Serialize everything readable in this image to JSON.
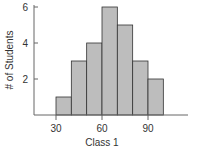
{
  "chart_data": {
    "type": "bar",
    "subtype": "histogram",
    "title": "",
    "xlabel": "Class 1",
    "ylabel": "# of Students",
    "bins": [
      [
        30,
        40
      ],
      [
        40,
        50
      ],
      [
        50,
        60
      ],
      [
        60,
        70
      ],
      [
        70,
        80
      ],
      [
        80,
        90
      ],
      [
        90,
        100
      ]
    ],
    "categories": [
      "30-40",
      "40-50",
      "50-60",
      "60-70",
      "70-80",
      "80-90",
      "90-100"
    ],
    "values": [
      1,
      3,
      4,
      6,
      5,
      3,
      2
    ],
    "xticks": [
      30,
      60,
      90
    ],
    "yticks": [
      2,
      4,
      6
    ],
    "xlim": [
      20,
      110
    ],
    "ylim": [
      0,
      6
    ],
    "grid": false,
    "legend": null,
    "colors": {
      "bar_fill": "#bdbdbd",
      "bar_edge": "#333333",
      "axis": "#555555",
      "text": "#333333"
    }
  }
}
